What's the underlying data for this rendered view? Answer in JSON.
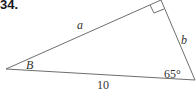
{
  "problem": {
    "number": "34."
  },
  "triangle": {
    "sides": {
      "a": "a",
      "b": "b",
      "hypotenuse": "10"
    },
    "angles": {
      "B": "B",
      "known_angle": "65°",
      "right_angle": "90°"
    },
    "colors": {
      "stroke": "#6e6e6e",
      "text": "#333333"
    }
  }
}
